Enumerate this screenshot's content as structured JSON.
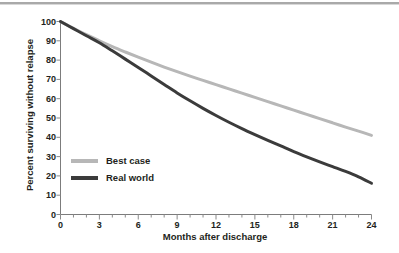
{
  "chart_data": {
    "type": "line",
    "title": "",
    "subtitle": "",
    "xlabel": "Months after discharge",
    "ylabel": "Percent surviving without relapse",
    "xlim": [
      0,
      24
    ],
    "ylim": [
      0,
      100
    ],
    "xticks": [
      "0",
      "3",
      "6",
      "9",
      "12",
      "15",
      "18",
      "21",
      "24"
    ],
    "xtick_values": [
      0,
      3,
      6,
      9,
      12,
      15,
      18,
      21,
      24
    ],
    "x_minor_tick_interval": 1,
    "yticks": [
      "0",
      "10",
      "20",
      "30",
      "40",
      "50",
      "60",
      "70",
      "80",
      "90",
      "100"
    ],
    "ytick_values": [
      0,
      10,
      20,
      30,
      40,
      50,
      60,
      70,
      80,
      90,
      100
    ],
    "grid": false,
    "legend_position": "inside-lower-left",
    "x": [
      0,
      1,
      2,
      3,
      4,
      5,
      6,
      7,
      8,
      9,
      10,
      11,
      12,
      13,
      14,
      15,
      16,
      17,
      18,
      19,
      20,
      21,
      22,
      23,
      24
    ],
    "series": [
      {
        "name": "Best case",
        "color": "#b7b7b7",
        "values": [
          100,
          96.5,
          93.2,
          90.0,
          87.0,
          84.2,
          81.5,
          78.9,
          76.4,
          74.0,
          71.7,
          69.5,
          67.3,
          65.1,
          62.9,
          60.7,
          58.5,
          56.3,
          54.1,
          51.9,
          49.7,
          47.5,
          45.3,
          43.2,
          41.0
        ]
      },
      {
        "name": "Real world",
        "color": "#3b3b3b",
        "values": [
          100,
          96.3,
          92.6,
          89.0,
          84.8,
          80.5,
          76.2,
          71.8,
          67.4,
          63.0,
          58.9,
          55.0,
          51.3,
          47.8,
          44.5,
          41.4,
          38.4,
          35.5,
          32.6,
          29.9,
          27.3,
          24.8,
          22.3,
          19.5,
          16.2
        ]
      }
    ]
  },
  "axes": {
    "axis_color": "#7c7c7c",
    "tick_color": "#8a8a8a"
  },
  "legend": {
    "items": [
      {
        "label": "Best case",
        "color": "#b7b7b7"
      },
      {
        "label": "Real world",
        "color": "#3b3b3b"
      }
    ]
  }
}
